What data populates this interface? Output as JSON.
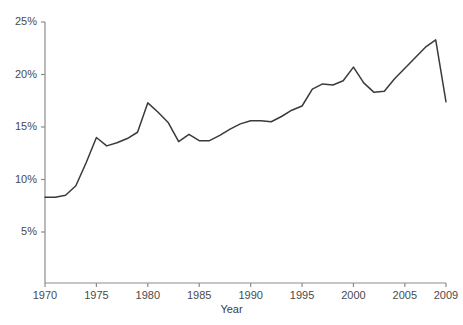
{
  "chart_data": {
    "type": "line",
    "title": "",
    "xlabel": "Year",
    "ylabel": "",
    "xlim": [
      1970,
      2009
    ],
    "ylim": [
      0,
      25
    ],
    "grid": false,
    "legend": null,
    "line_color": "#3a3a3a",
    "axis_color": "#8c8c8c",
    "tick_label_color": "#4a4a4a",
    "x_ticks": [
      1970,
      1975,
      1980,
      1985,
      1990,
      1995,
      2000,
      2005,
      2009
    ],
    "x_tick_labels": [
      "1970",
      "1975",
      "1980",
      "1985",
      "1990",
      "1995",
      "2000",
      "2005",
      "2009"
    ],
    "y_ticks": [
      5,
      10,
      15,
      20,
      25
    ],
    "y_tick_labels": [
      "5%",
      "10%",
      "15%",
      "20%",
      "25%"
    ],
    "x": [
      1970,
      1971,
      1972,
      1973,
      1974,
      1975,
      1976,
      1977,
      1978,
      1979,
      1980,
      1981,
      1982,
      1983,
      1984,
      1985,
      1986,
      1987,
      1988,
      1989,
      1990,
      1991,
      1992,
      1993,
      1994,
      1995,
      1996,
      1997,
      1998,
      1999,
      2000,
      2001,
      2002,
      2003,
      2004,
      2005,
      2006,
      2007,
      2008,
      2009
    ],
    "y": [
      8.3,
      8.3,
      8.5,
      9.4,
      11.6,
      14.0,
      13.2,
      13.5,
      13.9,
      14.5,
      17.3,
      16.4,
      15.4,
      13.6,
      14.3,
      13.7,
      13.7,
      14.2,
      14.8,
      15.3,
      15.6,
      15.6,
      15.5,
      16.0,
      16.6,
      17.0,
      18.6,
      19.1,
      19.0,
      19.4,
      20.7,
      19.2,
      18.3,
      18.4,
      19.6,
      20.6,
      21.6,
      22.6,
      23.3,
      17.4
    ]
  }
}
